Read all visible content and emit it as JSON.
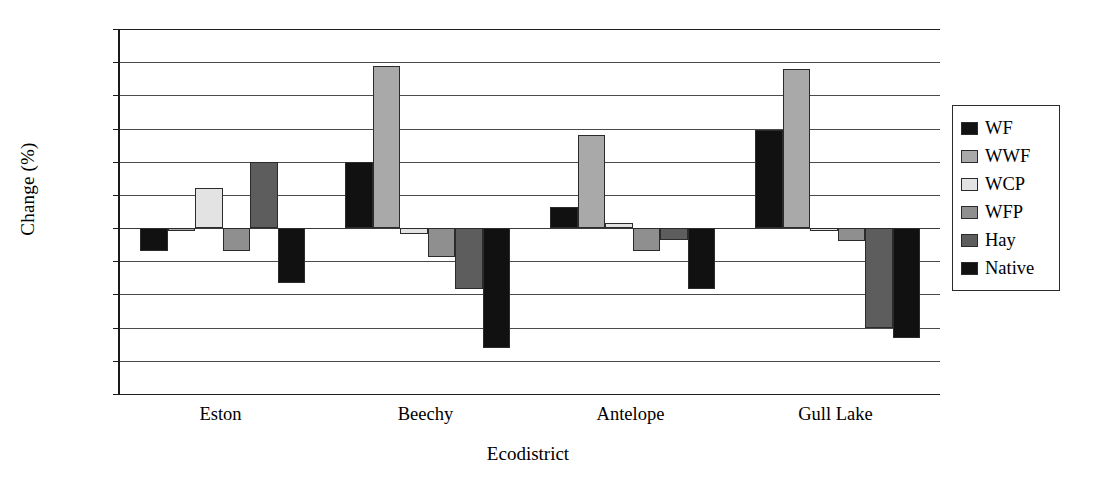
{
  "chart_data": {
    "type": "bar",
    "title": "",
    "xlabel": "Ecodistrict",
    "ylabel": "Change (%)",
    "ylim": [
      -10,
      12
    ],
    "ytick_step": 2,
    "yticks": [
      12,
      10,
      8,
      6,
      4,
      2,
      0,
      -2,
      -4,
      -6,
      -8,
      -10
    ],
    "ytick_labels": [
      "12",
      "10",
      "8",
      "6",
      "4",
      "2",
      "0",
      "-2",
      "-4",
      "-6",
      "-8",
      "-10"
    ],
    "grid": true,
    "grid_axis": "y",
    "legend_position": "right-outside",
    "categories": [
      "Eston",
      "Beechy",
      "Antelope",
      "Gull Lake"
    ],
    "series": [
      {
        "name": "WF",
        "color": "#111111",
        "values": [
          -1.4,
          4.0,
          1.3,
          5.9
        ]
      },
      {
        "name": "WWF",
        "color": "#a9a9a9",
        "values": [
          -0.2,
          9.75,
          5.6,
          9.6
        ]
      },
      {
        "name": "WCP",
        "color": "#e3e3e3",
        "values": [
          2.4,
          -0.35,
          0.3,
          -0.2
        ]
      },
      {
        "name": "WFP",
        "color": "#8f8f8f",
        "values": [
          -1.4,
          -1.75,
          -1.4,
          -0.8
        ]
      },
      {
        "name": "Hay",
        "color": "#5d5d5d",
        "values": [
          4.0,
          -3.7,
          -0.7,
          -6.0
        ]
      },
      {
        "name": "Native",
        "color": "#111111",
        "values": [
          -3.3,
          -7.2,
          -3.7,
          -6.6
        ]
      }
    ]
  },
  "axes": {
    "y_title": "Change (%)",
    "x_title": "Ecodistrict"
  },
  "legend": {
    "items": [
      {
        "label": "WF"
      },
      {
        "label": "WWF"
      },
      {
        "label": "WCP"
      },
      {
        "label": "WFP"
      },
      {
        "label": "Hay"
      },
      {
        "label": "Native"
      }
    ]
  }
}
